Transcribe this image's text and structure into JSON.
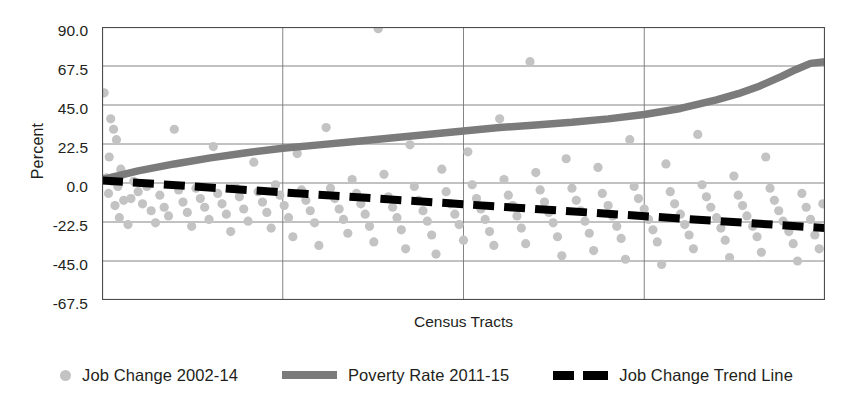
{
  "chart_data": {
    "type": "scatter",
    "title": "",
    "xlabel": "Census Tracts",
    "ylabel": "Percent",
    "ylim": [
      -67.5,
      90.0
    ],
    "yticks": [
      90.0,
      67.5,
      45.0,
      22.5,
      0.0,
      -22.5,
      -45.0,
      -67.5
    ],
    "ytick_labels": [
      "90.0",
      "67.5",
      "45.0",
      "22.5",
      "0.0",
      "-22.5",
      "-45.0",
      "-67.5"
    ],
    "xlim": [
      0,
      100
    ],
    "xticks": [
      0,
      25,
      50,
      75,
      100
    ],
    "xtick_labels": [
      "",
      "",
      "",
      "",
      ""
    ],
    "grid": "both",
    "legend_position": "bottom",
    "legend": [
      {
        "label": "Job Change 2002-14",
        "marker": "circle",
        "color": "#c3c3c3"
      },
      {
        "label": "Poverty Rate 2011-15",
        "marker": "solid-line",
        "color": "#7b7b7b"
      },
      {
        "label": "Job Change Trend Line",
        "marker": "dashed-line",
        "color": "#000000"
      }
    ],
    "series": [
      {
        "name": "Job Change 2002-14",
        "type": "scatter",
        "color": "#c3c3c3",
        "points": [
          [
            0.3,
            52.0
          ],
          [
            1.2,
            37.0
          ],
          [
            1.6,
            31.0
          ],
          [
            2.0,
            25.0
          ],
          [
            1.0,
            15.0
          ],
          [
            2.6,
            8.0
          ],
          [
            0.6,
            3.0
          ],
          [
            1.4,
            1.0
          ],
          [
            2.2,
            -2.0
          ],
          [
            0.9,
            -6.0
          ],
          [
            3.0,
            -10.0
          ],
          [
            1.8,
            -13.0
          ],
          [
            2.4,
            -20.0
          ],
          [
            3.6,
            -24.0
          ],
          [
            4.4,
            1.0
          ],
          [
            5.0,
            -5.0
          ],
          [
            4.0,
            -9.0
          ],
          [
            5.6,
            -12.0
          ],
          [
            6.2,
            -2.0
          ],
          [
            6.8,
            -16.0
          ],
          [
            7.4,
            -23.0
          ],
          [
            8.0,
            -7.0
          ],
          [
            8.6,
            -14.0
          ],
          [
            9.2,
            -19.0
          ],
          [
            10.0,
            31.0
          ],
          [
            10.6,
            -4.0
          ],
          [
            11.2,
            -11.0
          ],
          [
            11.8,
            -17.0
          ],
          [
            12.4,
            -25.0
          ],
          [
            13.0,
            -3.0
          ],
          [
            13.6,
            -9.0
          ],
          [
            14.2,
            -14.0
          ],
          [
            14.8,
            -21.0
          ],
          [
            15.4,
            21.0
          ],
          [
            16.0,
            -6.0
          ],
          [
            16.6,
            -12.0
          ],
          [
            17.2,
            -18.0
          ],
          [
            17.8,
            -28.0
          ],
          [
            18.4,
            -2.0
          ],
          [
            19.0,
            -8.0
          ],
          [
            19.6,
            -15.0
          ],
          [
            20.2,
            -22.0
          ],
          [
            21.0,
            12.0
          ],
          [
            21.6,
            -5.0
          ],
          [
            22.2,
            -11.0
          ],
          [
            22.8,
            -17.0
          ],
          [
            23.4,
            -26.0
          ],
          [
            24.0,
            -1.0
          ],
          [
            24.6,
            -7.0
          ],
          [
            25.2,
            -13.0
          ],
          [
            25.8,
            -20.0
          ],
          [
            26.4,
            -31.0
          ],
          [
            27.0,
            17.0
          ],
          [
            27.6,
            -4.0
          ],
          [
            28.2,
            -10.0
          ],
          [
            28.8,
            -16.0
          ],
          [
            29.4,
            -23.0
          ],
          [
            30.0,
            -36.0
          ],
          [
            31.0,
            32.0
          ],
          [
            31.6,
            -3.0
          ],
          [
            32.2,
            -9.0
          ],
          [
            32.8,
            -15.0
          ],
          [
            33.4,
            -21.0
          ],
          [
            34.0,
            -29.0
          ],
          [
            34.6,
            2.0
          ],
          [
            35.2,
            -6.0
          ],
          [
            35.8,
            -12.0
          ],
          [
            36.4,
            -18.0
          ],
          [
            37.0,
            -25.0
          ],
          [
            37.6,
            -34.0
          ],
          [
            38.2,
            89.0
          ],
          [
            39.0,
            5.0
          ],
          [
            39.6,
            -8.0
          ],
          [
            40.2,
            -14.0
          ],
          [
            40.8,
            -20.0
          ],
          [
            41.4,
            -27.0
          ],
          [
            42.0,
            -38.0
          ],
          [
            42.6,
            22.0
          ],
          [
            43.2,
            -2.0
          ],
          [
            43.8,
            -10.0
          ],
          [
            44.4,
            -16.0
          ],
          [
            45.0,
            -22.0
          ],
          [
            45.6,
            -30.0
          ],
          [
            46.2,
            -41.0
          ],
          [
            47.0,
            8.0
          ],
          [
            47.6,
            -5.0
          ],
          [
            48.2,
            -12.0
          ],
          [
            48.8,
            -18.0
          ],
          [
            49.4,
            -24.0
          ],
          [
            50.0,
            -33.0
          ],
          [
            50.6,
            18.0
          ],
          [
            51.2,
            -1.0
          ],
          [
            51.8,
            -9.0
          ],
          [
            52.4,
            -15.0
          ],
          [
            53.0,
            -21.0
          ],
          [
            53.6,
            -28.0
          ],
          [
            54.2,
            -36.0
          ],
          [
            55.0,
            37.0
          ],
          [
            55.6,
            2.0
          ],
          [
            56.2,
            -7.0
          ],
          [
            56.8,
            -13.0
          ],
          [
            57.4,
            -19.0
          ],
          [
            58.0,
            -26.0
          ],
          [
            58.6,
            -35.0
          ],
          [
            59.2,
            70.0
          ],
          [
            60.0,
            6.0
          ],
          [
            60.6,
            -4.0
          ],
          [
            61.2,
            -11.0
          ],
          [
            61.8,
            -17.0
          ],
          [
            62.4,
            -23.0
          ],
          [
            63.0,
            -31.0
          ],
          [
            63.6,
            -42.0
          ],
          [
            64.2,
            14.0
          ],
          [
            65.0,
            -3.0
          ],
          [
            65.6,
            -10.0
          ],
          [
            66.2,
            -16.0
          ],
          [
            66.8,
            -22.0
          ],
          [
            67.4,
            -29.0
          ],
          [
            68.0,
            -39.0
          ],
          [
            68.6,
            9.0
          ],
          [
            69.2,
            -6.0
          ],
          [
            70.0,
            -13.0
          ],
          [
            70.6,
            -19.0
          ],
          [
            71.2,
            -25.0
          ],
          [
            71.8,
            -32.0
          ],
          [
            72.4,
            -44.0
          ],
          [
            73.0,
            25.0
          ],
          [
            73.6,
            -2.0
          ],
          [
            74.2,
            -9.0
          ],
          [
            75.0,
            -15.0
          ],
          [
            75.6,
            -21.0
          ],
          [
            76.2,
            -27.0
          ],
          [
            76.8,
            -34.0
          ],
          [
            77.4,
            -47.0
          ],
          [
            78.0,
            11.0
          ],
          [
            78.6,
            -5.0
          ],
          [
            79.2,
            -12.0
          ],
          [
            80.0,
            -18.0
          ],
          [
            80.6,
            -24.0
          ],
          [
            81.2,
            -30.0
          ],
          [
            81.8,
            -38.0
          ],
          [
            82.4,
            28.0
          ],
          [
            83.0,
            -1.0
          ],
          [
            83.6,
            -8.0
          ],
          [
            84.2,
            -14.0
          ],
          [
            85.0,
            -20.0
          ],
          [
            85.6,
            -26.0
          ],
          [
            86.2,
            -33.0
          ],
          [
            86.8,
            -43.0
          ],
          [
            87.4,
            4.0
          ],
          [
            88.0,
            -7.0
          ],
          [
            88.6,
            -13.0
          ],
          [
            89.2,
            -19.0
          ],
          [
            90.0,
            -25.0
          ],
          [
            90.6,
            -31.0
          ],
          [
            91.2,
            -40.0
          ],
          [
            91.8,
            15.0
          ],
          [
            92.4,
            -3.0
          ],
          [
            93.0,
            -10.0
          ],
          [
            93.6,
            -16.0
          ],
          [
            94.2,
            -22.0
          ],
          [
            95.0,
            -28.0
          ],
          [
            95.6,
            -35.0
          ],
          [
            96.2,
            -45.0
          ],
          [
            96.8,
            -6.0
          ],
          [
            97.4,
            -14.0
          ],
          [
            98.0,
            -21.0
          ],
          [
            98.6,
            -30.0
          ],
          [
            99.2,
            -38.0
          ],
          [
            99.7,
            -12.0
          ]
        ]
      },
      {
        "name": "Poverty Rate 2011-15",
        "type": "line",
        "color": "#7b7b7b",
        "x": [
          0,
          5,
          10,
          15,
          20,
          25,
          30,
          35,
          40,
          45,
          50,
          55,
          60,
          65,
          70,
          75,
          80,
          85,
          88,
          91,
          94,
          96,
          98,
          100
        ],
        "y": [
          2.0,
          7.0,
          11.0,
          14.5,
          17.5,
          20.0,
          22.0,
          24.0,
          26.0,
          28.0,
          30.0,
          32.0,
          33.5,
          35.0,
          37.0,
          39.5,
          43.0,
          48.0,
          51.5,
          56.0,
          61.5,
          65.5,
          69.0,
          70.0
        ]
      },
      {
        "name": "Job Change Trend Line",
        "type": "trend-line",
        "color": "#000000",
        "x": [
          0,
          100
        ],
        "y": [
          1.5,
          -26.0
        ]
      }
    ]
  },
  "axes": {
    "y_title": "Percent",
    "x_title": "Census Tracts"
  }
}
